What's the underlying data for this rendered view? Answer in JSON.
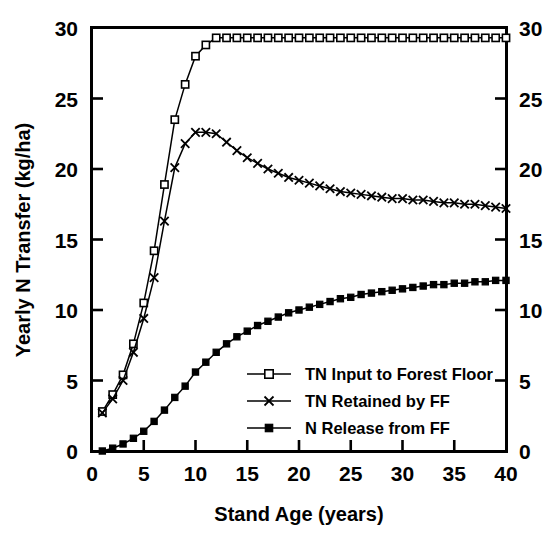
{
  "chart_data": {
    "type": "line",
    "title": "",
    "xlabel": "Stand Age (years)",
    "ylabel": "Yearly N Transfer (kg/ha)",
    "xlim": [
      0,
      40
    ],
    "ylim": [
      0,
      30
    ],
    "xticks": [
      0,
      5,
      10,
      15,
      20,
      25,
      30,
      35,
      40
    ],
    "yticks": [
      0,
      5,
      10,
      15,
      20,
      25,
      30
    ],
    "xticklabels": [
      "0",
      "5",
      "10",
      "15",
      "20",
      "25",
      "30",
      "35",
      "40"
    ],
    "yticklabels": [
      "0",
      "5",
      "10",
      "15",
      "20",
      "25",
      "30"
    ],
    "right_axis_ticklabels": [
      "0",
      "5",
      "10",
      "15",
      "20",
      "25",
      "30"
    ],
    "grid": false,
    "legend_position": "lower right inside",
    "x": [
      1,
      2,
      3,
      4,
      5,
      6,
      7,
      8,
      9,
      10,
      11,
      12,
      13,
      14,
      15,
      16,
      17,
      18,
      19,
      20,
      21,
      22,
      23,
      24,
      25,
      26,
      27,
      28,
      29,
      30,
      31,
      32,
      33,
      34,
      35,
      36,
      37,
      38,
      39,
      40
    ],
    "series": [
      {
        "name": "TN Input to Forest Floor",
        "marker": "open-square",
        "values": [
          2.8,
          4.0,
          5.4,
          7.6,
          10.5,
          14.2,
          18.9,
          23.5,
          26.0,
          28.0,
          28.8,
          29.3,
          29.3,
          29.3,
          29.3,
          29.3,
          29.3,
          29.3,
          29.3,
          29.3,
          29.3,
          29.3,
          29.3,
          29.3,
          29.3,
          29.3,
          29.3,
          29.3,
          29.3,
          29.3,
          29.3,
          29.3,
          29.3,
          29.3,
          29.3,
          29.3,
          29.3,
          29.3,
          29.3,
          29.3
        ]
      },
      {
        "name": "TN Retained by FF",
        "marker": "cross",
        "values": [
          2.7,
          3.7,
          5.0,
          7.0,
          9.4,
          12.3,
          16.3,
          20.1,
          21.8,
          22.6,
          22.6,
          22.5,
          21.9,
          21.3,
          20.8,
          20.4,
          20.0,
          19.7,
          19.4,
          19.2,
          19.0,
          18.8,
          18.6,
          18.4,
          18.3,
          18.2,
          18.1,
          18.0,
          17.9,
          17.9,
          17.8,
          17.8,
          17.7,
          17.6,
          17.6,
          17.5,
          17.5,
          17.4,
          17.3,
          17.2
        ]
      },
      {
        "name": "N Release from FF",
        "marker": "filled-square",
        "values": [
          0.0,
          0.2,
          0.5,
          0.9,
          1.4,
          2.1,
          2.9,
          3.8,
          4.6,
          5.6,
          6.3,
          7.0,
          7.6,
          8.1,
          8.5,
          8.9,
          9.2,
          9.5,
          9.8,
          10.0,
          10.2,
          10.4,
          10.6,
          10.8,
          10.9,
          11.1,
          11.2,
          11.3,
          11.4,
          11.5,
          11.6,
          11.7,
          11.8,
          11.8,
          11.9,
          11.9,
          12.0,
          12.0,
          12.1,
          12.1
        ]
      }
    ]
  },
  "legend": {
    "items": [
      {
        "label": "TN Input to Forest Floor",
        "marker": "open-square"
      },
      {
        "label": "TN Retained by FF",
        "marker": "cross"
      },
      {
        "label": "N Release from FF",
        "marker": "filled-square"
      }
    ]
  },
  "colors": {
    "line": "#000000",
    "background": "#ffffff",
    "marker_fill_open": "#ffffff",
    "marker_fill_closed": "#000000"
  }
}
